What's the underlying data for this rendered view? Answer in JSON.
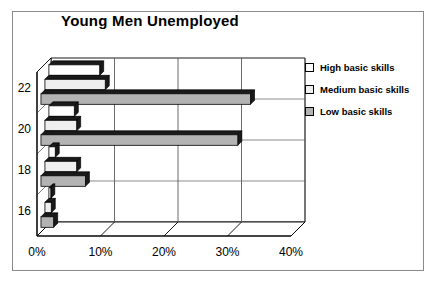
{
  "chart_data": {
    "type": "bar",
    "orientation": "horizontal",
    "title": "Young Men Unemployed",
    "xlabel": "",
    "ylabel": "",
    "categories": [
      "16",
      "18",
      "20",
      "22"
    ],
    "category_axis_labels": [
      "22",
      "20",
      "18",
      "16"
    ],
    "xlim": [
      0,
      40
    ],
    "xticks": [
      0,
      10,
      20,
      30,
      40
    ],
    "xtick_labels": [
      "0%",
      "10%",
      "20%",
      "30%",
      "40%"
    ],
    "grid": true,
    "grid_axis": "x",
    "legend_position": "right",
    "style": "3d-bar",
    "series": [
      {
        "name": "High basic skills",
        "color": "#ffffff",
        "values": [
          0.3,
          1.0,
          4.0,
          8.0
        ]
      },
      {
        "name": "Medium basic skills",
        "color": "#efefef",
        "values": [
          1.0,
          5.0,
          5.0,
          9.5
        ]
      },
      {
        "name": "Low basic skills",
        "color": "#b3b3b3",
        "values": [
          2.0,
          7.0,
          31.0,
          33.0
        ]
      }
    ]
  },
  "legend": {
    "items": [
      {
        "label": "High basic skills",
        "color": "#ffffff"
      },
      {
        "label": "Medium basic skills",
        "color": "#efefef"
      },
      {
        "label": "Low basic skills",
        "color": "#b3b3b3"
      }
    ]
  },
  "colors": {
    "bar_high": "#ffffff",
    "bar_medium": "#efefef",
    "bar_low": "#b3b3b3",
    "bar_side": "#1a1a1a",
    "axis": "#000000",
    "grid": "#5a5a5a",
    "frame": "#8a8a8a"
  }
}
